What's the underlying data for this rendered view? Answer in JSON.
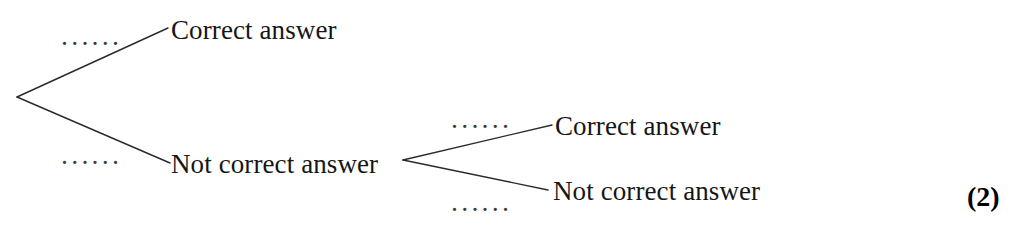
{
  "figure": {
    "type": "probability-tree-diagram",
    "background_color": "#ffffff",
    "line_color": "#2b2b2b",
    "text_color": "#161616"
  },
  "tree": {
    "stage1": {
      "root": {
        "x": 17,
        "y": 97
      },
      "branches": [
        {
          "id": "s1-upper",
          "label": "Correct answer",
          "probability_label": "······",
          "line": {
            "x1": 17,
            "y1": 97,
            "x2": 168,
            "y2": 28
          }
        },
        {
          "id": "s1-lower",
          "label": "Not correct answer",
          "probability_label": "······",
          "line": {
            "x1": 17,
            "y1": 97,
            "x2": 170,
            "y2": 163
          }
        }
      ]
    },
    "stage2": {
      "root": {
        "x": 403,
        "y": 160
      },
      "branches": [
        {
          "id": "s2-upper",
          "label": "Correct answer",
          "probability_label": "······",
          "line": {
            "x1": 403,
            "y1": 160,
            "x2": 552,
            "y2": 125
          }
        },
        {
          "id": "s2-lower",
          "label": "Not correct answer",
          "probability_label": "······",
          "line": {
            "x1": 403,
            "y1": 160,
            "x2": 548,
            "y2": 190
          }
        }
      ]
    }
  },
  "marks": {
    "value": "(2)"
  }
}
